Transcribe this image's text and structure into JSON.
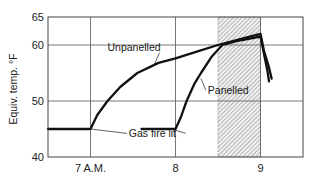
{
  "chart_data": {
    "type": "line",
    "title": "",
    "xlabel": "",
    "ylabel": "Equiv. temp. °F",
    "xlim": [
      6.5,
      9.5
    ],
    "ylim": [
      40,
      65
    ],
    "x_ticks": [
      {
        "value": 7,
        "label": "7 A.M."
      },
      {
        "value": 8,
        "label": "8"
      },
      {
        "value": 9,
        "label": "9"
      }
    ],
    "y_ticks": [
      {
        "value": 40,
        "label": "40"
      },
      {
        "value": 50,
        "label": "50"
      },
      {
        "value": 60,
        "label": "60"
      },
      {
        "value": 65,
        "label": "65"
      }
    ],
    "grid": true,
    "legend": null,
    "series": [
      {
        "name": "Unpanelled",
        "points": [
          [
            6.5,
            45
          ],
          [
            7.0,
            45
          ],
          [
            7.08,
            47.5
          ],
          [
            7.2,
            50
          ],
          [
            7.35,
            52.5
          ],
          [
            7.55,
            55
          ],
          [
            7.8,
            56.8
          ],
          [
            8.0,
            57.6
          ],
          [
            8.25,
            58.8
          ],
          [
            8.5,
            60
          ],
          [
            8.75,
            61
          ],
          [
            9.0,
            62
          ],
          [
            9.04,
            59
          ],
          [
            9.1,
            56
          ],
          [
            9.13,
            54
          ]
        ]
      },
      {
        "name": "Panelled",
        "points": [
          [
            7.6,
            45
          ],
          [
            8.0,
            45
          ],
          [
            8.06,
            47
          ],
          [
            8.13,
            50
          ],
          [
            8.22,
            53
          ],
          [
            8.3,
            55
          ],
          [
            8.42,
            57.8
          ],
          [
            8.55,
            60
          ],
          [
            8.75,
            60.8
          ],
          [
            9.0,
            61.5
          ],
          [
            9.04,
            58.5
          ],
          [
            9.08,
            55.5
          ],
          [
            9.1,
            53.5
          ]
        ]
      }
    ],
    "shaded_region": {
      "x_start": 8.5,
      "x_end": 9.0,
      "pattern": "diagonal hatch"
    },
    "annotations": [
      {
        "text": "Unpanelled",
        "x": 7.2,
        "y": 59,
        "points_to": [
          7.75,
          56.5
        ]
      },
      {
        "text": "Panelled",
        "x": 8.38,
        "y": 51.2,
        "points_to": [
          8.3,
          54
        ]
      },
      {
        "text": "Gas fire lit",
        "x": 7.45,
        "y": 43.5,
        "points_to": [
          [
            7.0,
            45
          ],
          [
            7.95,
            45
          ]
        ]
      }
    ]
  }
}
